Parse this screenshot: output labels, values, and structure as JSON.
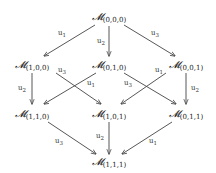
{
  "diagram": {
    "type": "lattice",
    "nodes": [
      {
        "id": "n000",
        "symbol": "𝓜",
        "sub": "(0,0,0)",
        "x": 109,
        "y": 20
      },
      {
        "id": "n100",
        "symbol": "𝓜",
        "sub": "(1,0,0)",
        "x": 32,
        "y": 68
      },
      {
        "id": "n010",
        "symbol": "𝓜",
        "sub": "(0,1,0)",
        "x": 109,
        "y": 68
      },
      {
        "id": "n001",
        "symbol": "𝓜",
        "sub": "(0,0,1)",
        "x": 186,
        "y": 68
      },
      {
        "id": "n110",
        "symbol": "𝓜",
        "sub": "(1,1,0)",
        "x": 32,
        "y": 117
      },
      {
        "id": "n101",
        "symbol": "𝓜",
        "sub": "(1,0,1)",
        "x": 109,
        "y": 117
      },
      {
        "id": "n011",
        "symbol": "𝓜",
        "sub": "(0,1,1)",
        "x": 186,
        "y": 117
      },
      {
        "id": "n111",
        "symbol": "𝓜",
        "sub": "(1,1,1)",
        "x": 109,
        "y": 165
      }
    ],
    "edges": [
      {
        "from": "n000",
        "to": "n100",
        "label": "u",
        "label_sub": "1",
        "x1": 95,
        "y1": 25,
        "x2": 44,
        "y2": 56,
        "lx": 58,
        "ly": 35
      },
      {
        "from": "n000",
        "to": "n010",
        "label": "u",
        "label_sub": "2",
        "x1": 109,
        "y1": 26,
        "x2": 109,
        "y2": 56,
        "lx": 97,
        "ly": 43
      },
      {
        "from": "n000",
        "to": "n001",
        "label": "u",
        "label_sub": "3",
        "x1": 124,
        "y1": 25,
        "x2": 175,
        "y2": 56,
        "lx": 151,
        "ly": 35
      },
      {
        "from": "n100",
        "to": "n110",
        "label": "u",
        "label_sub": "2",
        "x1": 32,
        "y1": 73,
        "x2": 32,
        "y2": 104,
        "lx": 18,
        "ly": 90
      },
      {
        "from": "n100",
        "to": "n101",
        "label": "u",
        "label_sub": "3",
        "x1": 56,
        "y1": 73,
        "x2": 101,
        "y2": 104,
        "lx": 58,
        "ly": 72
      },
      {
        "from": "n010",
        "to": "n110",
        "label": "u",
        "label_sub": "1",
        "x1": 96,
        "y1": 73,
        "x2": 44,
        "y2": 104,
        "lx": 87,
        "ly": 85
      },
      {
        "from": "n010",
        "to": "n011",
        "label": "u",
        "label_sub": "3",
        "x1": 124,
        "y1": 73,
        "x2": 176,
        "y2": 104,
        "lx": 124,
        "ly": 85
      },
      {
        "from": "n001",
        "to": "n101",
        "label": "u",
        "label_sub": "1",
        "x1": 166,
        "y1": 73,
        "x2": 121,
        "y2": 104,
        "lx": 155,
        "ly": 72
      },
      {
        "from": "n001",
        "to": "n011",
        "label": "u",
        "label_sub": "2",
        "x1": 186,
        "y1": 73,
        "x2": 186,
        "y2": 104,
        "lx": 191,
        "ly": 90
      },
      {
        "from": "n110",
        "to": "n111",
        "label": "u",
        "label_sub": "3",
        "x1": 48,
        "y1": 122,
        "x2": 96,
        "y2": 154,
        "lx": 55,
        "ly": 143
      },
      {
        "from": "n101",
        "to": "n111",
        "label": "u",
        "label_sub": "2",
        "x1": 109,
        "y1": 122,
        "x2": 109,
        "y2": 154,
        "lx": 96,
        "ly": 138
      },
      {
        "from": "n011",
        "to": "n111",
        "label": "u",
        "label_sub": "1",
        "x1": 172,
        "y1": 122,
        "x2": 122,
        "y2": 154,
        "lx": 149,
        "ly": 143
      }
    ]
  }
}
